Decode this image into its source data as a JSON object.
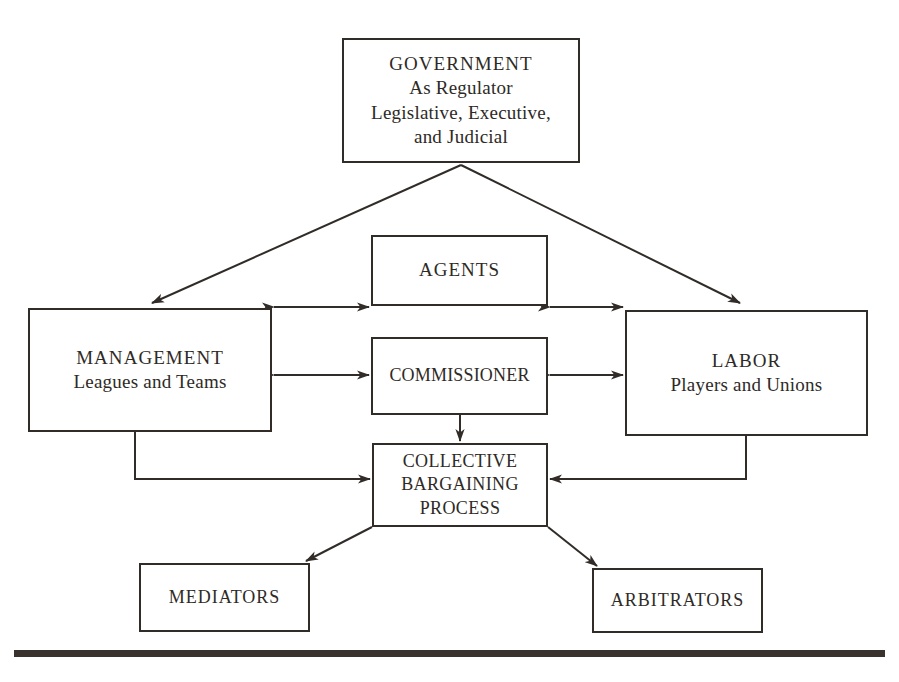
{
  "diagram": {
    "background_color": "#ffffff",
    "line_color": "#312c28",
    "rule_color": "#3a332d"
  },
  "nodes": {
    "government": {
      "name": "GOVERNMENT",
      "line2": "As Regulator",
      "line3": "Legislative, Executive,",
      "line4": "and Judicial"
    },
    "agents": {
      "name": "AGENTS"
    },
    "management": {
      "name": "MANAGEMENT",
      "line2": "Leagues and Teams"
    },
    "commissioner": {
      "name": "COMMISSIONER"
    },
    "labor": {
      "name": "LABOR",
      "line2": "Players and Unions"
    },
    "collective_bargaining": {
      "line1": "COLLECTIVE",
      "line2": "BARGAINING",
      "line3": "PROCESS"
    },
    "mediators": {
      "name": "MEDIATORS"
    },
    "arbitrators": {
      "name": "ARBITRATORS"
    }
  },
  "connections": [
    {
      "id": "gov-to-management",
      "from": "government",
      "to": "management",
      "style": "diagonal",
      "arrowheads": "one-way"
    },
    {
      "id": "gov-to-labor",
      "from": "government",
      "to": "labor",
      "style": "diagonal",
      "arrowheads": "one-way"
    },
    {
      "id": "management-agents",
      "from": "management",
      "to": "agents",
      "style": "horizontal",
      "arrowheads": "two-way"
    },
    {
      "id": "agents-labor",
      "from": "agents",
      "to": "labor",
      "style": "horizontal",
      "arrowheads": "two-way"
    },
    {
      "id": "management-commissioner",
      "from": "management",
      "to": "commissioner",
      "style": "horizontal",
      "arrowheads": "two-way"
    },
    {
      "id": "commissioner-labor",
      "from": "commissioner",
      "to": "labor",
      "style": "horizontal",
      "arrowheads": "two-way"
    },
    {
      "id": "commissioner-cbp",
      "from": "commissioner",
      "to": "collective_bargaining",
      "style": "vertical",
      "arrowheads": "one-way"
    },
    {
      "id": "management-cbp",
      "from": "management",
      "to": "collective_bargaining",
      "style": "elbow",
      "arrowheads": "one-way"
    },
    {
      "id": "labor-cbp",
      "from": "labor",
      "to": "collective_bargaining",
      "style": "elbow",
      "arrowheads": "one-way"
    },
    {
      "id": "cbp-mediators",
      "from": "collective_bargaining",
      "to": "mediators",
      "style": "diagonal",
      "arrowheads": "one-way"
    },
    {
      "id": "cbp-arbitrators",
      "from": "collective_bargaining",
      "to": "arbitrators",
      "style": "diagonal",
      "arrowheads": "one-way"
    }
  ]
}
